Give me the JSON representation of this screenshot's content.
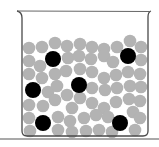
{
  "diagram": {
    "type": "beaker-particles",
    "colors": {
      "solvent_particle": "#b3b3b3",
      "solute_particle": "#000000",
      "beaker_outline": "#4a4a4a",
      "background": "#ffffff"
    },
    "solute_particles": [
      {
        "x": 53,
        "y": 59
      },
      {
        "x": 128,
        "y": 56
      },
      {
        "x": 79,
        "y": 85
      },
      {
        "x": 33,
        "y": 90
      },
      {
        "x": 43,
        "y": 123
      },
      {
        "x": 120,
        "y": 123
      }
    ],
    "solvent_particles": [
      {
        "x": 29,
        "y": 48
      },
      {
        "x": 42,
        "y": 47
      },
      {
        "x": 55,
        "y": 43
      },
      {
        "x": 67,
        "y": 46
      },
      {
        "x": 80,
        "y": 44
      },
      {
        "x": 92,
        "y": 47
      },
      {
        "x": 104,
        "y": 49
      },
      {
        "x": 117,
        "y": 47
      },
      {
        "x": 130,
        "y": 41
      },
      {
        "x": 141,
        "y": 47
      },
      {
        "x": 29,
        "y": 61
      },
      {
        "x": 40,
        "y": 66
      },
      {
        "x": 68,
        "y": 58
      },
      {
        "x": 79,
        "y": 56
      },
      {
        "x": 91,
        "y": 59
      },
      {
        "x": 104,
        "y": 56
      },
      {
        "x": 113,
        "y": 62
      },
      {
        "x": 141,
        "y": 60
      },
      {
        "x": 29,
        "y": 74
      },
      {
        "x": 42,
        "y": 78
      },
      {
        "x": 55,
        "y": 74
      },
      {
        "x": 66,
        "y": 71
      },
      {
        "x": 80,
        "y": 69
      },
      {
        "x": 92,
        "y": 72
      },
      {
        "x": 104,
        "y": 78
      },
      {
        "x": 116,
        "y": 75
      },
      {
        "x": 128,
        "y": 72
      },
      {
        "x": 140,
        "y": 74
      },
      {
        "x": 48,
        "y": 92
      },
      {
        "x": 57,
        "y": 86
      },
      {
        "x": 67,
        "y": 95
      },
      {
        "x": 92,
        "y": 88
      },
      {
        "x": 105,
        "y": 90
      },
      {
        "x": 117,
        "y": 88
      },
      {
        "x": 130,
        "y": 86
      },
      {
        "x": 141,
        "y": 87
      },
      {
        "x": 29,
        "y": 105
      },
      {
        "x": 43,
        "y": 106
      },
      {
        "x": 55,
        "y": 100
      },
      {
        "x": 72,
        "y": 108
      },
      {
        "x": 80,
        "y": 98
      },
      {
        "x": 92,
        "y": 103
      },
      {
        "x": 104,
        "y": 108
      },
      {
        "x": 116,
        "y": 102
      },
      {
        "x": 129,
        "y": 99
      },
      {
        "x": 140,
        "y": 101
      },
      {
        "x": 29,
        "y": 118
      },
      {
        "x": 58,
        "y": 117
      },
      {
        "x": 70,
        "y": 121
      },
      {
        "x": 84,
        "y": 118
      },
      {
        "x": 96,
        "y": 115
      },
      {
        "x": 108,
        "y": 117
      },
      {
        "x": 133,
        "y": 112
      },
      {
        "x": 140,
        "y": 118
      },
      {
        "x": 30,
        "y": 131
      },
      {
        "x": 58,
        "y": 130
      },
      {
        "x": 72,
        "y": 132
      },
      {
        "x": 86,
        "y": 131
      },
      {
        "x": 99,
        "y": 130
      },
      {
        "x": 112,
        "y": 132
      },
      {
        "x": 135,
        "y": 130
      }
    ]
  }
}
